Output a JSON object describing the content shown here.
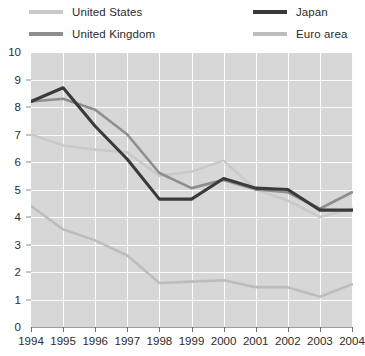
{
  "legend": {
    "position": "top",
    "entries": [
      {
        "label": "United States",
        "color": "#c9c9c9",
        "key": "united-states"
      },
      {
        "label": "United Kingdom",
        "color": "#8e8e8e",
        "key": "united-kingdom"
      },
      {
        "label": "Japan",
        "color": "#3a3a3a",
        "key": "japan"
      },
      {
        "label": "Euro area",
        "color": "#bdbdbd",
        "key": "euro-area"
      }
    ]
  },
  "colors": {
    "plot_background": "#d7d7d7",
    "gridline": "#fcfcfc",
    "axis_text": "#2b2b2b",
    "united_states": "#c9c9c9",
    "united_kingdom": "#8e8e8e",
    "japan": "#3a3a3a",
    "euro_area": "#bdbdbd"
  },
  "chart_data": {
    "type": "line",
    "title": "",
    "subtitle": "",
    "xlabel": "",
    "ylabel": "",
    "grid": true,
    "legend_position": "top",
    "x": [
      1994,
      1995,
      1996,
      1997,
      1998,
      1999,
      2000,
      2001,
      2002,
      2003,
      2004
    ],
    "xtick_labels": [
      "1994",
      "1995",
      "1996",
      "1997",
      "1998",
      "1999",
      "2000",
      "2001",
      "2002",
      "2003",
      "2004"
    ],
    "xlim": [
      1994,
      2004
    ],
    "ylim": [
      0,
      10
    ],
    "ytick_labels": [
      "0",
      "1",
      "2",
      "3",
      "4",
      "5",
      "6",
      "7",
      "8",
      "9",
      "10"
    ],
    "yticks": [
      0,
      1,
      2,
      3,
      4,
      5,
      6,
      7,
      8,
      9,
      10
    ],
    "series": [
      {
        "name": "United States",
        "color": "#c9c9c9",
        "values": [
          7.0,
          6.6,
          6.45,
          6.35,
          5.5,
          5.65,
          6.05,
          5.0,
          4.6,
          4.0,
          4.3
        ]
      },
      {
        "name": "United Kingdom",
        "color": "#8e8e8e",
        "values": [
          8.2,
          8.3,
          7.9,
          7.0,
          5.6,
          5.05,
          5.35,
          5.0,
          4.9,
          4.3,
          4.9
        ]
      },
      {
        "name": "Japan",
        "color": "#3a3a3a",
        "values": [
          8.2,
          8.7,
          7.3,
          6.1,
          4.65,
          4.65,
          5.4,
          5.05,
          5.0,
          4.25,
          4.25
        ]
      },
      {
        "name": "Euro area",
        "color": "#bdbdbd",
        "values": [
          4.4,
          3.55,
          3.15,
          2.6,
          1.6,
          1.65,
          1.7,
          1.45,
          1.45,
          1.1,
          1.55
        ]
      }
    ]
  }
}
